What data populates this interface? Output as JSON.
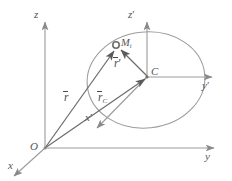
{
  "figure": {
    "type": "geometry-diagram",
    "background_color": "#ffffff",
    "line_color": "#9a9a9a",
    "label_color": "#555555",
    "vector_color": "#6a6a6a"
  },
  "axes": {
    "global": {
      "origin_label": "O",
      "z_label": "z",
      "y_label": "y",
      "x_label": "x"
    },
    "local": {
      "origin_label": "C",
      "z_label": "z",
      "z_prime": "′",
      "y_label": "y",
      "y_prime": "′",
      "x_label": "x",
      "x_prime": "′"
    }
  },
  "points": {
    "particle": {
      "label": "M",
      "subscript": "i"
    },
    "center": {
      "label": "C"
    },
    "origin": {
      "label": "O"
    }
  },
  "vectors": [
    {
      "name": "r",
      "label": "r",
      "subscript": "",
      "from": "O",
      "to": "M_i"
    },
    {
      "name": "r_C",
      "label": "r",
      "subscript": "C",
      "from": "O",
      "to": "C"
    },
    {
      "name": "r_prime",
      "label": "r",
      "subscript": "",
      "prime": "′",
      "from": "C",
      "to": "M_i"
    }
  ],
  "body": {
    "shape": "ellipse",
    "note": "rigid body cross-section"
  }
}
